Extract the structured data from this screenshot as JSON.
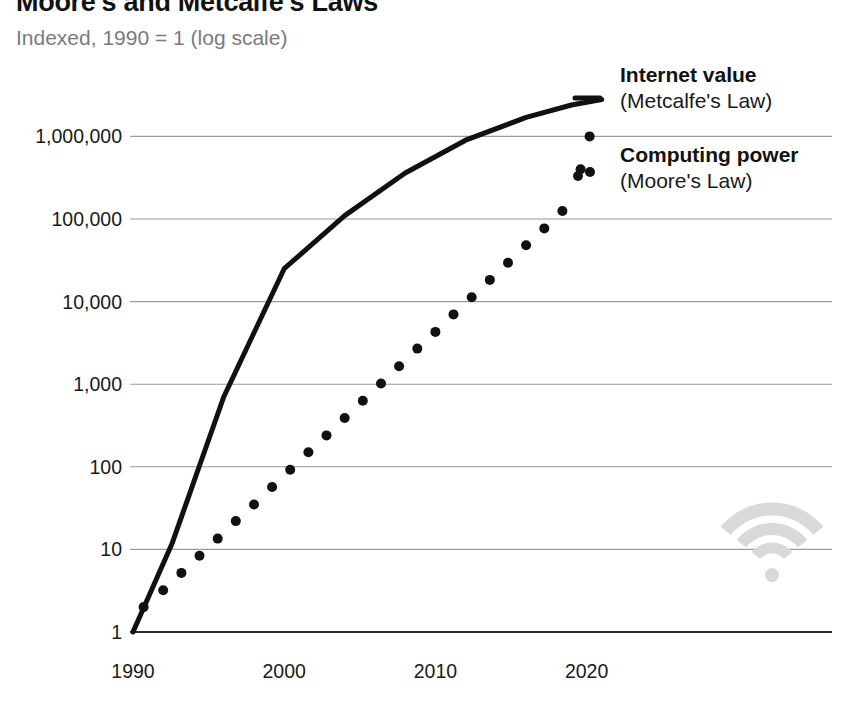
{
  "header": {
    "title": "Moore's and Metcalfe's Laws",
    "subtitle": "Indexed, 1990 = 1 (log scale)"
  },
  "legend": {
    "items": [
      {
        "title": "Internet value",
        "subtitle": "(Metcalfe's Law)",
        "marker": "solid-line-swatch",
        "color": "#111111"
      },
      {
        "title": "Computing power",
        "subtitle": "(Moore's Law)",
        "marker": "dotted-line-swatch",
        "color": "#111111"
      }
    ]
  },
  "watermark": {
    "icon": "wifi-icon",
    "color": "#d9d9d9"
  },
  "chart_data": {
    "type": "line",
    "title": "Moore's and Metcalfe's Laws",
    "subtitle": "Indexed, 1990 = 1 (log scale)",
    "xlabel": "",
    "ylabel": "",
    "yscale": "log",
    "ylim": [
      1,
      10000000
    ],
    "xlim": [
      1990,
      2023
    ],
    "grid": true,
    "gridlines_y": [
      1,
      10,
      100,
      1000,
      10000,
      100000,
      1000000
    ],
    "ytick_labels": [
      "1",
      "10",
      "100",
      "1,000",
      "10,000",
      "100,000",
      "1,000,000"
    ],
    "ytick_values": [
      1,
      10,
      100,
      1000,
      10000,
      100000,
      1000000
    ],
    "xtick_labels": [
      "1990",
      "2000",
      "2010",
      "2020"
    ],
    "xtick_values": [
      1990,
      2000,
      2010,
      2020
    ],
    "legend_position": "top-right",
    "series": [
      {
        "name": "Internet value",
        "sublabel": "(Metcalfe's Law)",
        "style": "solid",
        "color": "#111111",
        "width": 5,
        "x": [
          1990,
          1992.6,
          1996.0,
          2000.0,
          2004.0,
          2008.0,
          2012.0,
          2016.0,
          2019.0,
          2021.0
        ],
        "y": [
          1,
          12,
          700,
          25000,
          110000,
          360000,
          900000,
          1700000,
          2400000,
          2800000
        ]
      },
      {
        "name": "Computing power",
        "sublabel": "(Moore's Law)",
        "style": "dotted",
        "color": "#111111",
        "dot_radius": 5,
        "x": [
          1990.7,
          1992.0,
          1993.2,
          1994.4,
          1995.6,
          1996.8,
          1998.0,
          1999.2,
          2000.4,
          2001.6,
          2002.8,
          2004.0,
          2005.2,
          2006.4,
          2007.6,
          2008.8,
          2010.0,
          2011.2,
          2012.4,
          2013.6,
          2014.8,
          2016.0,
          2017.2,
          2018.4,
          2019.6,
          2020.2
        ],
        "y": [
          2,
          3.2,
          5.2,
          8.4,
          13.5,
          22,
          35,
          57,
          92,
          150,
          240,
          390,
          630,
          1020,
          1650,
          2700,
          4300,
          7000,
          11300,
          18300,
          29600,
          48000,
          77000,
          125000,
          400000,
          1000000
        ]
      }
    ]
  }
}
